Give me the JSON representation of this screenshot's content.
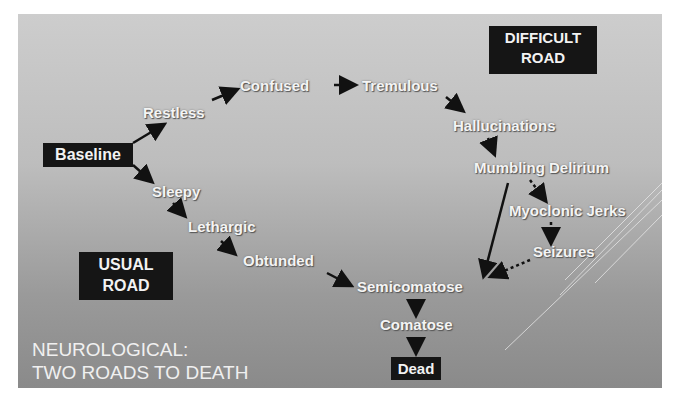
{
  "title": "NEUROLOGICAL:\nTWO ROADS TO DEATH",
  "labels": {
    "difficult_road": "DIFFICULT\nROAD",
    "usual_road": "USUAL\nROAD"
  },
  "nodes": {
    "baseline": "Baseline",
    "restless": "Restless",
    "confused": "Confused",
    "tremulous": "Tremulous",
    "hallucinations": "Hallucinations",
    "mumbling_delirium": "Mumbling Delirium",
    "myoclonic_jerks": "Myoclonic Jerks",
    "seizures": "Seizures",
    "sleepy": "Sleepy",
    "lethargic": "Lethargic",
    "obtunded": "Obtunded",
    "semicomatose": "Semicomatose",
    "comatose": "Comatose",
    "dead": "Dead"
  },
  "edges": [
    {
      "from": "baseline",
      "to": "restless",
      "style": "solid"
    },
    {
      "from": "restless",
      "to": "confused",
      "style": "solid"
    },
    {
      "from": "confused",
      "to": "tremulous",
      "style": "solid"
    },
    {
      "from": "tremulous",
      "to": "hallucinations",
      "style": "solid"
    },
    {
      "from": "hallucinations",
      "to": "mumbling_delirium",
      "style": "solid"
    },
    {
      "from": "mumbling_delirium",
      "to": "myoclonic_jerks",
      "style": "dotted"
    },
    {
      "from": "myoclonic_jerks",
      "to": "seizures",
      "style": "dotted"
    },
    {
      "from": "seizures",
      "to": "semicomatose",
      "style": "dotted"
    },
    {
      "from": "mumbling_delirium",
      "to": "semicomatose",
      "style": "solid"
    },
    {
      "from": "baseline",
      "to": "sleepy",
      "style": "solid"
    },
    {
      "from": "sleepy",
      "to": "lethargic",
      "style": "solid"
    },
    {
      "from": "lethargic",
      "to": "obtunded",
      "style": "solid"
    },
    {
      "from": "obtunded",
      "to": "semicomatose",
      "style": "solid"
    },
    {
      "from": "semicomatose",
      "to": "comatose",
      "style": "solid"
    },
    {
      "from": "comatose",
      "to": "dead",
      "style": "solid"
    }
  ]
}
